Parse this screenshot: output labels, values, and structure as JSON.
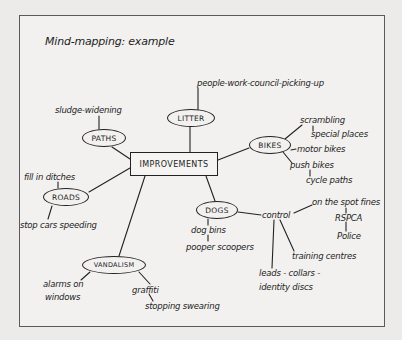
{
  "title": "Mind-mapping: example",
  "center": {
    "label": "IMPROVEMENTS"
  },
  "branches": {
    "litter": {
      "label": "LITTER",
      "notes": [
        "people-work-council-picking-up"
      ]
    },
    "paths": {
      "label": "PATHS",
      "notes": [
        "sludge-widening"
      ]
    },
    "bikes": {
      "label": "BIKES",
      "notes": [
        "scrambling",
        "special places",
        "motor bikes",
        "push bikes",
        "cycle paths"
      ]
    },
    "roads": {
      "label": "ROADS",
      "notes": [
        "fill in ditches",
        "stop cars speeding"
      ]
    },
    "dogs": {
      "label": "DOGS",
      "notes": [
        "dog bins",
        "pooper scoopers"
      ],
      "control": {
        "label": "control",
        "notes": [
          "on the spot fines",
          "RSPCA",
          "Police",
          "training centres",
          "leads - collars -",
          "identity discs"
        ]
      }
    },
    "vandalism": {
      "label": "VANDALISM",
      "notes": [
        "alarms on",
        "windows",
        "graffiti",
        "stopping swearing"
      ]
    }
  },
  "colors": {
    "ink": "#1d1d1d",
    "paper": "#f2f1ef",
    "background": "#ecebe9",
    "frame": "#5a5a5a"
  }
}
